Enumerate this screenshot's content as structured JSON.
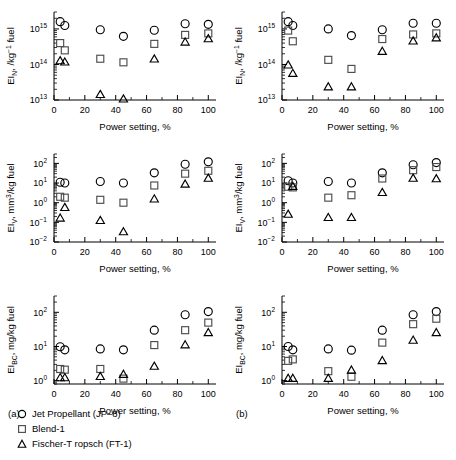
{
  "figure": {
    "panel_a_label": "(a)",
    "panel_b_label": "(b)",
    "xlabel": "Power setting, %",
    "xticks": [
      "0",
      "20",
      "40",
      "60",
      "80",
      "100"
    ],
    "xlim": [
      0,
      105
    ]
  },
  "legend": {
    "items": [
      {
        "marker": "circle",
        "label": "Jet Propellant (JP–8)"
      },
      {
        "marker": "square",
        "label": "Blend-1"
      },
      {
        "marker": "triangle",
        "label": "Fischer-T ropsch (FT-1)"
      }
    ]
  },
  "chart_data": [
    {
      "id": "a-top",
      "type": "scatter",
      "panel": "(a)",
      "title": "",
      "xlabel": "Power setting, %",
      "ylabel": "EI_N, /kg⁻¹ fuel",
      "ylabel_parts": {
        "pre": "EI",
        "sub": "N",
        "post": ", /kg",
        "sup": "−1",
        "tail": " fuel"
      },
      "xlim": [
        0,
        105
      ],
      "ylim": [
        10000000000000.0,
        3000000000000000.0
      ],
      "yticks": [
        10000000000000.0,
        100000000000000.0,
        1000000000000000.0
      ],
      "ytick_labels": [
        "10",
        "10",
        "10"
      ],
      "ytick_exponents": [
        "13",
        "14",
        "15"
      ],
      "log_y": true,
      "grid": false,
      "series": [
        {
          "name": "Jet Propellant (JP–8)",
          "marker": "circle",
          "points": [
            [
              4,
              1600000000000000.0
            ],
            [
              7,
              1250000000000000.0
            ],
            [
              30,
              950000000000000.0
            ],
            [
              45,
              620000000000000.0
            ],
            [
              65,
              920000000000000.0
            ],
            [
              85,
              1400000000000000.0
            ],
            [
              100,
              1350000000000000.0
            ]
          ]
        },
        {
          "name": "Blend-1",
          "marker": "square",
          "points": [
            [
              4,
              400000000000000.0
            ],
            [
              7,
              250000000000000.0
            ],
            [
              30,
              145000000000000.0
            ],
            [
              45,
              115000000000000.0
            ],
            [
              65,
              380000000000000.0
            ],
            [
              85,
              680000000000000.0
            ],
            [
              100,
              750000000000000.0
            ]
          ]
        },
        {
          "name": "Fischer-T ropsch (FT-1)",
          "marker": "triangle",
          "points": [
            [
              4,
              125000000000000.0
            ],
            [
              7,
              115000000000000.0
            ],
            [
              30,
              14000000000000.0
            ],
            [
              45,
              10500000000000.0
            ],
            [
              65,
              140000000000000.0
            ],
            [
              85,
              420000000000000.0
            ],
            [
              100,
              520000000000000.0
            ]
          ]
        }
      ]
    },
    {
      "id": "a-mid",
      "type": "scatter",
      "panel": "(a)",
      "xlabel": "Power setting, %",
      "ylabel": "EI_V, mm³/kg fuel",
      "ylabel_parts": {
        "pre": "EI",
        "sub": "V",
        "post": ", mm",
        "sup": "3",
        "tail": "/kg fuel"
      },
      "xlim": [
        0,
        105
      ],
      "ylim": [
        0.01,
        300
      ],
      "yticks": [
        0.01,
        0.1,
        1,
        10,
        100
      ],
      "ytick_labels": [
        "10",
        "10",
        "10",
        "10",
        "10"
      ],
      "ytick_exponents": [
        "−2",
        "−1",
        "0",
        "1",
        "2"
      ],
      "log_y": true,
      "grid": false,
      "series": [
        {
          "name": "Jet Propellant (JP–8)",
          "marker": "circle",
          "points": [
            [
              4,
              11
            ],
            [
              7,
              10
            ],
            [
              30,
              12
            ],
            [
              45,
              10
            ],
            [
              65,
              33
            ],
            [
              85,
              90
            ],
            [
              100,
              120
            ]
          ]
        },
        {
          "name": "Blend-1",
          "marker": "square",
          "points": [
            [
              4,
              2.0
            ],
            [
              7,
              1.8
            ],
            [
              30,
              1.4
            ],
            [
              45,
              1.0
            ],
            [
              65,
              7.5
            ],
            [
              85,
              30
            ],
            [
              100,
              42
            ]
          ]
        },
        {
          "name": "Fischer-T ropsch (FT-1)",
          "marker": "triangle",
          "points": [
            [
              4,
              0.16
            ],
            [
              7,
              0.55
            ],
            [
              30,
              0.12
            ],
            [
              45,
              0.032
            ],
            [
              65,
              1.5
            ],
            [
              85,
              8.5
            ],
            [
              100,
              17
            ]
          ]
        }
      ]
    },
    {
      "id": "a-bot",
      "type": "scatter",
      "panel": "(a)",
      "xlabel": "Power setting, %",
      "ylabel": "EI_BC, mg/kg fuel",
      "ylabel_parts": {
        "pre": "EI",
        "sub": "BC",
        "post": ", mg/kg fuel",
        "sup": "",
        "tail": ""
      },
      "xlim": [
        0,
        105
      ],
      "ylim": [
        0.8,
        300
      ],
      "yticks": [
        1,
        10,
        100
      ],
      "ytick_labels": [
        "10",
        "10",
        "10"
      ],
      "ytick_exponents": [
        "0",
        "1",
        "2"
      ],
      "log_y": true,
      "grid": false,
      "series": [
        {
          "name": "Jet Propellant (JP–8)",
          "marker": "circle",
          "points": [
            [
              4,
              9.8
            ],
            [
              7,
              8.0
            ],
            [
              30,
              8.5
            ],
            [
              45,
              8.0
            ],
            [
              65,
              30
            ],
            [
              85,
              85
            ],
            [
              100,
              105
            ]
          ]
        },
        {
          "name": "Blend-1",
          "marker": "square",
          "points": [
            [
              4,
              2.2
            ],
            [
              7,
              2.1
            ],
            [
              30,
              2.2
            ],
            [
              45,
              1.15
            ],
            [
              65,
              11
            ],
            [
              85,
              30
            ],
            [
              100,
              50
            ]
          ]
        },
        {
          "name": "Fischer-T ropsch (FT-1)",
          "marker": "triangle",
          "points": [
            [
              4,
              1.2
            ],
            [
              7,
              1.2
            ],
            [
              30,
              1.3
            ],
            [
              45,
              1.5
            ],
            [
              65,
              2.6
            ],
            [
              85,
              11
            ],
            [
              100,
              25
            ]
          ]
        }
      ]
    },
    {
      "id": "b-top",
      "type": "scatter",
      "panel": "(b)",
      "xlabel": "Power setting, %",
      "ylabel": "EI_N, /kg⁻¹ fuel",
      "ylabel_parts": {
        "pre": "EI",
        "sub": "N",
        "post": ", /kg",
        "sup": "−1",
        "tail": " fuel"
      },
      "xlim": [
        0,
        105
      ],
      "ylim": [
        10000000000000.0,
        3000000000000000.0
      ],
      "yticks": [
        10000000000000.0,
        100000000000000.0,
        1000000000000000.0
      ],
      "ytick_labels": [
        "10",
        "10",
        "10"
      ],
      "ytick_exponents": [
        "13",
        "14",
        "15"
      ],
      "log_y": true,
      "grid": false,
      "series": [
        {
          "name": "Jet Propellant (JP–8)",
          "marker": "circle",
          "points": [
            [
              4,
              1600000000000000.0
            ],
            [
              7,
              1250000000000000.0
            ],
            [
              30,
              1000000000000000.0
            ],
            [
              45,
              650000000000000.0
            ],
            [
              65,
              950000000000000.0
            ],
            [
              85,
              1450000000000000.0
            ],
            [
              100,
              1450000000000000.0
            ]
          ]
        },
        {
          "name": "Blend-1",
          "marker": "square",
          "points": [
            [
              4,
              900000000000000.0
            ],
            [
              7,
              450000000000000.0
            ],
            [
              30,
              135000000000000.0
            ],
            [
              45,
              75000000000000.0
            ],
            [
              65,
              520000000000000.0
            ],
            [
              85,
              700000000000000.0
            ],
            [
              100,
              750000000000000.0
            ]
          ]
        },
        {
          "name": "Fischer-T ropsch (FT-1)",
          "marker": "triangle",
          "points": [
            [
              4,
              95000000000000.0
            ],
            [
              7,
              55000000000000.0
            ],
            [
              30,
              23000000000000.0
            ],
            [
              45,
              23000000000000.0
            ],
            [
              65,
              230000000000000.0
            ],
            [
              85,
              450000000000000.0
            ],
            [
              100,
              550000000000000.0
            ]
          ]
        }
      ]
    },
    {
      "id": "b-mid",
      "type": "scatter",
      "panel": "(b)",
      "xlabel": "Power setting, %",
      "ylabel": "EI_V, mm³/kg fuel",
      "ylabel_parts": {
        "pre": "EI",
        "sub": "V",
        "post": ", mm",
        "sup": "3",
        "tail": "/kg fuel"
      },
      "xlim": [
        0,
        105
      ],
      "ylim": [
        0.01,
        300
      ],
      "yticks": [
        0.01,
        0.1,
        1,
        10,
        100
      ],
      "ytick_labels": [
        "10",
        "10",
        "10",
        "10",
        "10"
      ],
      "ytick_exponents": [
        "−2",
        "−1",
        "0",
        "1",
        "2"
      ],
      "log_y": true,
      "grid": false,
      "series": [
        {
          "name": "Jet Propellant (JP–8)",
          "marker": "circle",
          "points": [
            [
              4,
              13
            ],
            [
              7,
              10
            ],
            [
              30,
              12
            ],
            [
              45,
              10
            ],
            [
              65,
              33
            ],
            [
              85,
              85
            ],
            [
              100,
              110
            ]
          ]
        },
        {
          "name": "Blend-1",
          "marker": "square",
          "points": [
            [
              4,
              6.5
            ],
            [
              7,
              6.0
            ],
            [
              30,
              1.8
            ],
            [
              45,
              2.4
            ],
            [
              65,
              17
            ],
            [
              85,
              45
            ],
            [
              100,
              65
            ]
          ]
        },
        {
          "name": "Fischer-T ropsch (FT-1)",
          "marker": "triangle",
          "points": [
            [
              4,
              0.25
            ],
            [
              7,
              6.5
            ],
            [
              30,
              0.17
            ],
            [
              45,
              0.17
            ],
            [
              65,
              3.2
            ],
            [
              85,
              17
            ],
            [
              100,
              16
            ]
          ]
        }
      ]
    },
    {
      "id": "b-bot",
      "type": "scatter",
      "panel": "(b)",
      "xlabel": "Power setting, %",
      "ylabel": "EI_BC, mg/kg fuel",
      "ylabel_parts": {
        "pre": "EI",
        "sub": "BC",
        "post": ", mg/kg fuel",
        "sup": "",
        "tail": ""
      },
      "xlim": [
        0,
        105
      ],
      "ylim": [
        0.8,
        300
      ],
      "yticks": [
        1,
        10,
        100
      ],
      "ytick_labels": [
        "10",
        "10",
        "10"
      ],
      "ytick_exponents": [
        "0",
        "1",
        "2"
      ],
      "log_y": true,
      "grid": false,
      "series": [
        {
          "name": "Jet Propellant (JP–8)",
          "marker": "circle",
          "points": [
            [
              4,
              10
            ],
            [
              7,
              8.0
            ],
            [
              30,
              8.5
            ],
            [
              45,
              7.8
            ],
            [
              65,
              30
            ],
            [
              85,
              85
            ],
            [
              100,
              105
            ]
          ]
        },
        {
          "name": "Blend-1",
          "marker": "square",
          "points": [
            [
              4,
              3.8
            ],
            [
              7,
              4.2
            ],
            [
              30,
              1.9
            ],
            [
              45,
              1.3
            ],
            [
              65,
              13
            ],
            [
              85,
              45
            ],
            [
              100,
              65
            ]
          ]
        },
        {
          "name": "Fischer-T ropsch (FT-1)",
          "marker": "triangle",
          "points": [
            [
              4,
              1.15
            ],
            [
              7,
              1.15
            ],
            [
              30,
              1.15
            ],
            [
              45,
              2.0
            ],
            [
              65,
              3.8
            ],
            [
              85,
              15
            ],
            [
              100,
              25
            ]
          ]
        }
      ]
    }
  ]
}
